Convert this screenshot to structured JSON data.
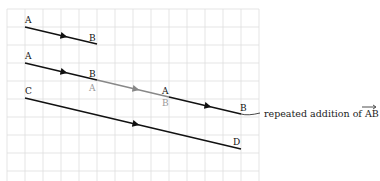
{
  "diagram": {
    "grid": {
      "x0": 7,
      "y0": 9,
      "cell": 18,
      "cols": 14,
      "rows": 10,
      "color": "#dcdcdc"
    },
    "vectors": [
      {
        "id": "ab-original",
        "start_label": "A",
        "end_label": "B",
        "x1": 25,
        "y1": 27,
        "x2": 97,
        "y2": 44,
        "color": "#111111"
      },
      {
        "id": "ab-first",
        "start_label": "A",
        "end_label": "B",
        "x1": 25,
        "y1": 63,
        "x2": 97,
        "y2": 80,
        "color": "#111111"
      },
      {
        "id": "ab-second",
        "start_label": "A",
        "end_label": "B",
        "x1": 97,
        "y1": 80,
        "x2": 169,
        "y2": 97,
        "color": "#888888"
      },
      {
        "id": "ab-third",
        "start_label": "A",
        "end_label": "B",
        "x1": 169,
        "y1": 97,
        "x2": 241,
        "y2": 114,
        "color": "#111111"
      },
      {
        "id": "cd-result",
        "start_label": "C",
        "end_label": "D",
        "x1": 25,
        "y1": 98,
        "x2": 241,
        "y2": 149,
        "color": "#111111"
      }
    ],
    "labels": {
      "a1": "A",
      "b1": "B",
      "a2": "A",
      "b2": "B",
      "a3": "A",
      "b3": "B",
      "a4": "A",
      "b4": "B",
      "c": "C",
      "d": "D"
    },
    "caption": {
      "text": "repeated addition of ",
      "vector": "AB"
    }
  }
}
